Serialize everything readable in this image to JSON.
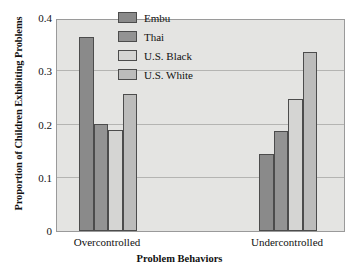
{
  "chart_data": {
    "type": "bar",
    "title": "",
    "xlabel": "Problem Behaviors",
    "ylabel": "Proportion of Children Exhibiting Problems",
    "categories": [
      "Overcontrolled",
      "Undercontrolled"
    ],
    "series": [
      {
        "name": "Embu",
        "values": [
          0.365,
          0.145
        ],
        "color": "#8a8a8a"
      },
      {
        "name": "Thai",
        "values": [
          0.201,
          0.188
        ],
        "color": "#939393"
      },
      {
        "name": "U.S. Black",
        "values": [
          0.19,
          0.248
        ],
        "color": "#d5d5d3"
      },
      {
        "name": "U.S. White",
        "values": [
          0.257,
          0.337
        ],
        "color": "#bcbcbb"
      }
    ],
    "ylim": [
      0,
      0.4
    ],
    "yticks": [
      0,
      0.1,
      0.2,
      0.3,
      0.4
    ],
    "ytick_labels": [
      "0",
      "0.1",
      "0.2",
      "0.3",
      "0.4"
    ],
    "grid": true,
    "legend_position": "top-center",
    "plot_background": "#e4e4e2",
    "grid_color": "#b4b4b2",
    "bar_edge_color": "#4c4c4c"
  }
}
